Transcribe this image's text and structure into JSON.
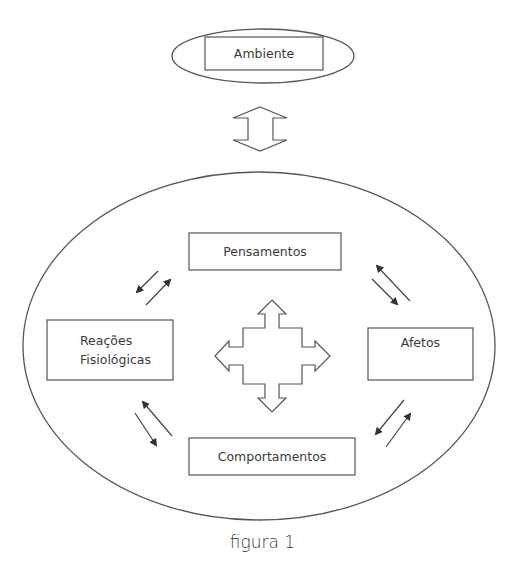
{
  "diagram": {
    "type": "cognitive-behavioral-model",
    "environment": {
      "label": "Ambiente",
      "connector": "bidirectional-block-arrow"
    },
    "nodes": [
      {
        "id": "pensamentos",
        "label": "Pensamentos",
        "position": "top"
      },
      {
        "id": "reacoes",
        "label_line1": "Reações",
        "label_line2": "Fisiológicas",
        "position": "left"
      },
      {
        "id": "afetos",
        "label": "Afetos",
        "position": "right"
      },
      {
        "id": "comportamentos",
        "label": "Comportamentos",
        "position": "bottom"
      }
    ],
    "edges": [
      {
        "from": "pensamentos",
        "to": "reacoes",
        "type": "bidirectional-pair"
      },
      {
        "from": "pensamentos",
        "to": "afetos",
        "type": "bidirectional-pair"
      },
      {
        "from": "reacoes",
        "to": "comportamentos",
        "type": "bidirectional-pair"
      },
      {
        "from": "afetos",
        "to": "comportamentos",
        "type": "bidirectional-pair"
      }
    ],
    "center_icon": "four-way-block-arrow",
    "caption": "figura 1"
  },
  "style": {
    "stroke": "#555555",
    "text": "#3a3a3a",
    "background": "#ffffff"
  }
}
